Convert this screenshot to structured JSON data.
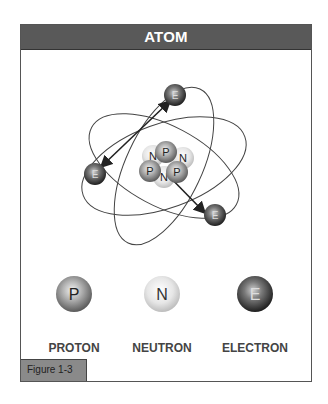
{
  "header": {
    "title": "ATOM"
  },
  "diagram": {
    "nucleus": {
      "particles": [
        {
          "type": "neutron",
          "label": "N"
        },
        {
          "type": "proton",
          "label": "P"
        },
        {
          "type": "neutron",
          "label": "N"
        },
        {
          "type": "proton",
          "label": "P"
        },
        {
          "type": "neutron",
          "label": "N"
        },
        {
          "type": "proton",
          "label": "P"
        }
      ]
    },
    "electrons": [
      {
        "label": "E"
      },
      {
        "label": "E"
      },
      {
        "label": "E"
      }
    ],
    "orbit_count": 3
  },
  "legend": [
    {
      "symbol": "P",
      "label": "PROTON"
    },
    {
      "symbol": "N",
      "label": "NEUTRON"
    },
    {
      "symbol": "E",
      "label": "ELECTRON"
    }
  ],
  "figure_label": "Figure 1-3",
  "colors": {
    "header_bg": "#595959",
    "proton": "#7a7a7a",
    "neutron": "#d9d9d9",
    "electron": "#3a3a3a",
    "tab_bg": "#8a8a8a"
  }
}
